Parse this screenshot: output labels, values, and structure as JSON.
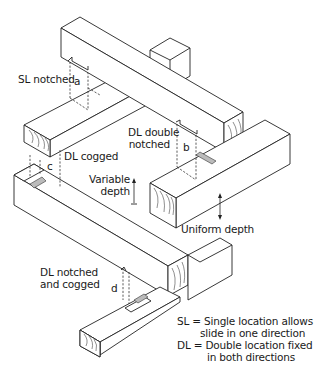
{
  "diagram": {
    "labels": {
      "sl_notched": "SL notched",
      "a": "a",
      "dl_double_notched_line1": "DL double",
      "dl_double_notched_line2": "notched",
      "b": "b",
      "dl_cogged": "DL cogged",
      "c": "c",
      "variable_depth_line1": "Variable",
      "variable_depth_line2": "depth",
      "uniform_depth": "Uniform depth",
      "dl_notched_cogged_line1": "DL notched",
      "dl_notched_cogged_line2": "and cogged",
      "d": "d"
    },
    "legend": {
      "sl_line1": "SL = Single location allows",
      "sl_line2": "slide in one direction",
      "dl_line1": "DL = Double location fixed",
      "dl_line2": "in both directions"
    },
    "colors": {
      "line": "#222222",
      "background": "#ffffff",
      "hatch": "#bbbbbb"
    }
  }
}
